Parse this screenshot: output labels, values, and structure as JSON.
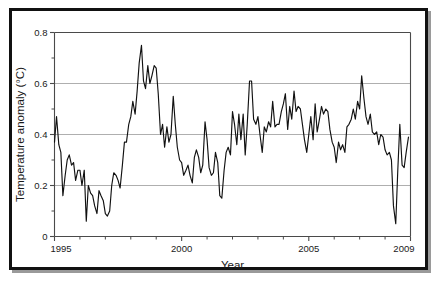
{
  "figure": {
    "background_color": "#ffffff",
    "frame_color": "#111111",
    "line_color": "#111111",
    "grid_color": "#9b9b9b"
  },
  "chart_data": {
    "type": "line",
    "title": "",
    "xlabel": "Year",
    "ylabel": "Temperature anomaly (°C)",
    "xlim": [
      1995,
      2009
    ],
    "ylim": [
      0,
      0.8
    ],
    "grid": true,
    "grid_axis": "y",
    "legend_position": "none",
    "x_tick_labels": [
      "1995",
      "2000",
      "2005",
      "2009"
    ],
    "x_tick_values": [
      1995,
      2000,
      2005,
      2009
    ],
    "x_minor_tick_values": [
      1996,
      1997,
      1998,
      1999,
      2001,
      2002,
      2003,
      2004,
      2006,
      2007,
      2008
    ],
    "y_tick_labels": [
      "0",
      "0.2",
      "0.4",
      "0.6",
      "0.8"
    ],
    "y_tick_values": [
      0,
      0.2,
      0.4,
      0.6,
      0.8
    ],
    "y_minor_tick_values": [
      0.1,
      0.3,
      0.5,
      0.7
    ],
    "gridline_values": [
      0.2,
      0.4,
      0.6
    ],
    "series": [
      {
        "name": "Global temperature anomaly",
        "x": [
          1995.0,
          1995.08,
          1995.17,
          1995.25,
          1995.33,
          1995.42,
          1995.5,
          1995.58,
          1995.67,
          1995.75,
          1995.83,
          1995.92,
          1996.0,
          1996.08,
          1996.17,
          1996.25,
          1996.33,
          1996.42,
          1996.5,
          1996.58,
          1996.67,
          1996.75,
          1996.83,
          1996.92,
          1997.0,
          1997.08,
          1997.17,
          1997.25,
          1997.33,
          1997.42,
          1997.5,
          1997.58,
          1997.67,
          1997.75,
          1997.83,
          1997.92,
          1998.0,
          1998.08,
          1998.17,
          1998.25,
          1998.33,
          1998.42,
          1998.5,
          1998.58,
          1998.67,
          1998.75,
          1998.83,
          1998.92,
          1999.0,
          1999.08,
          1999.17,
          1999.25,
          1999.33,
          1999.42,
          1999.5,
          1999.58,
          1999.67,
          1999.75,
          1999.83,
          1999.92,
          2000.0,
          2000.08,
          2000.17,
          2000.25,
          2000.33,
          2000.42,
          2000.5,
          2000.58,
          2000.67,
          2000.75,
          2000.83,
          2000.92,
          2001.0,
          2001.08,
          2001.17,
          2001.25,
          2001.33,
          2001.42,
          2001.5,
          2001.58,
          2001.67,
          2001.75,
          2001.83,
          2001.92,
          2002.0,
          2002.08,
          2002.17,
          2002.25,
          2002.33,
          2002.42,
          2002.5,
          2002.58,
          2002.67,
          2002.75,
          2002.83,
          2002.92,
          2003.0,
          2003.08,
          2003.17,
          2003.25,
          2003.33,
          2003.42,
          2003.5,
          2003.58,
          2003.67,
          2003.75,
          2003.83,
          2003.92,
          2004.0,
          2004.08,
          2004.17,
          2004.25,
          2004.33,
          2004.42,
          2004.5,
          2004.58,
          2004.67,
          2004.75,
          2004.83,
          2004.92,
          2005.0,
          2005.08,
          2005.17,
          2005.25,
          2005.33,
          2005.42,
          2005.5,
          2005.58,
          2005.67,
          2005.75,
          2005.83,
          2005.92,
          2006.0,
          2006.08,
          2006.17,
          2006.25,
          2006.33,
          2006.42,
          2006.5,
          2006.58,
          2006.67,
          2006.75,
          2006.83,
          2006.92,
          2007.0,
          2007.08,
          2007.17,
          2007.25,
          2007.33,
          2007.42,
          2007.5,
          2007.58,
          2007.67,
          2007.75,
          2007.83,
          2007.92,
          2008.0,
          2008.08,
          2008.17,
          2008.25,
          2008.33,
          2008.42,
          2008.5,
          2008.58,
          2008.67,
          2008.75,
          2008.83,
          2008.92
        ],
        "values": [
          0.37,
          0.47,
          0.36,
          0.33,
          0.16,
          0.24,
          0.3,
          0.32,
          0.28,
          0.29,
          0.22,
          0.26,
          0.26,
          0.2,
          0.26,
          0.06,
          0.2,
          0.17,
          0.16,
          0.12,
          0.09,
          0.18,
          0.16,
          0.14,
          0.09,
          0.08,
          0.1,
          0.2,
          0.25,
          0.24,
          0.22,
          0.19,
          0.28,
          0.37,
          0.37,
          0.44,
          0.47,
          0.53,
          0.48,
          0.57,
          0.68,
          0.75,
          0.61,
          0.58,
          0.67,
          0.6,
          0.63,
          0.67,
          0.66,
          0.56,
          0.4,
          0.44,
          0.35,
          0.43,
          0.37,
          0.4,
          0.55,
          0.44,
          0.35,
          0.3,
          0.29,
          0.24,
          0.26,
          0.28,
          0.24,
          0.21,
          0.31,
          0.34,
          0.31,
          0.25,
          0.28,
          0.45,
          0.38,
          0.27,
          0.24,
          0.25,
          0.33,
          0.29,
          0.16,
          0.15,
          0.26,
          0.33,
          0.35,
          0.32,
          0.49,
          0.44,
          0.36,
          0.48,
          0.38,
          0.48,
          0.32,
          0.44,
          0.61,
          0.61,
          0.46,
          0.44,
          0.47,
          0.4,
          0.33,
          0.43,
          0.41,
          0.45,
          0.43,
          0.53,
          0.43,
          0.44,
          0.44,
          0.49,
          0.52,
          0.56,
          0.42,
          0.51,
          0.46,
          0.57,
          0.49,
          0.51,
          0.5,
          0.44,
          0.38,
          0.33,
          0.4,
          0.47,
          0.38,
          0.52,
          0.41,
          0.46,
          0.51,
          0.48,
          0.5,
          0.49,
          0.42,
          0.37,
          0.35,
          0.29,
          0.37,
          0.34,
          0.36,
          0.33,
          0.43,
          0.44,
          0.46,
          0.5,
          0.46,
          0.53,
          0.5,
          0.63,
          0.54,
          0.47,
          0.44,
          0.48,
          0.41,
          0.4,
          0.41,
          0.36,
          0.4,
          0.39,
          0.34,
          0.32,
          0.33,
          0.3,
          0.12,
          0.05,
          0.26,
          0.44,
          0.28,
          0.27,
          0.33,
          0.39
        ]
      }
    ]
  }
}
